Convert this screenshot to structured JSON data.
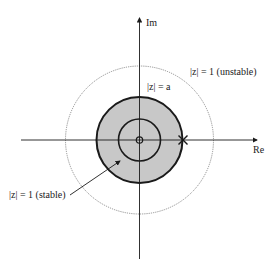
{
  "diagram": {
    "axes": {
      "x_label": "Re",
      "y_label": "Im"
    },
    "circles": [
      {
        "name": "unit-circle-unstable",
        "label": "|z| = 1 (unstable)",
        "style": "dotted",
        "radius_px": 74
      },
      {
        "name": "unit-circle-stable",
        "label": "|z| = 1 (stable)",
        "style": "solid-shaded",
        "radius_px": 43,
        "fill": "#c8c8c8"
      },
      {
        "name": "circle-a",
        "label": "|z| = a",
        "style": "solid",
        "radius_px": 21
      }
    ],
    "markers": [
      {
        "name": "origin-zero",
        "type": "circle"
      },
      {
        "name": "pole-x",
        "type": "cross",
        "position": "|z| = 1 on real axis"
      }
    ],
    "colors": {
      "shade": "#c8c8c8",
      "stroke": "#1a1a1a",
      "dotted": "#777777"
    }
  }
}
